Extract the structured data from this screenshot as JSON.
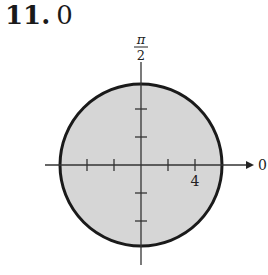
{
  "problem": {
    "number": "11.",
    "answer": "0"
  },
  "graph": {
    "type": "polar",
    "description": "Shaded disk of radius 5 centered at pole",
    "radius": 5,
    "tick_spacing": 2,
    "axis_labels": {
      "polar_axis": "0",
      "vertical": "π/2",
      "vertical_num": "π",
      "vertical_den": "2"
    },
    "tick_labels": [
      {
        "value": 4,
        "label": "4"
      }
    ],
    "colors": {
      "fill": "#d6d6d6",
      "stroke": "#1a1a1a",
      "axis": "#333333"
    }
  }
}
